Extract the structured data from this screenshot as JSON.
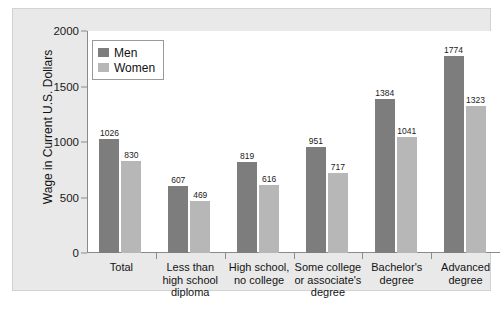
{
  "chart_data": {
    "type": "bar",
    "title": "",
    "xlabel": "",
    "ylabel": "Wage in Current U.S. Dollars",
    "ylim": [
      0,
      2000
    ],
    "yticks": [
      "0",
      "500",
      "1000",
      "1500",
      "2000"
    ],
    "grid": false,
    "legend_position": "top-left-inside",
    "categories": [
      "Total",
      "Less than\nhigh school\ndiploma",
      "High school,\nno college",
      "Some college\nor associate's\ndegree",
      "Bachelor's\ndegree",
      "Advanced\ndegree"
    ],
    "category_lines": [
      [
        "Total"
      ],
      [
        "Less than",
        "high school",
        "diploma"
      ],
      [
        "High school,",
        "no college"
      ],
      [
        "Some college",
        "or associate's",
        "degree"
      ],
      [
        "Bachelor's",
        "degree"
      ],
      [
        "Advanced",
        "degree"
      ]
    ],
    "series": [
      {
        "name": "Men",
        "color": "#7d7d7d",
        "values": [
          1026,
          607,
          819,
          951,
          1384,
          1774
        ]
      },
      {
        "name": "Women",
        "color": "#b7b7b7",
        "values": [
          830,
          469,
          616,
          717,
          1041,
          1323
        ]
      }
    ]
  },
  "legend": {
    "items": [
      {
        "label": "Men",
        "color": "#7d7d7d"
      },
      {
        "label": "Women",
        "color": "#b7b7b7"
      }
    ]
  },
  "colors": {
    "men": "#7d7d7d",
    "women": "#b7b7b7",
    "axis": "#8a8a8a",
    "figure_background": "#e9e9e9",
    "plot_background": "#ffffff",
    "text": "#141414"
  }
}
